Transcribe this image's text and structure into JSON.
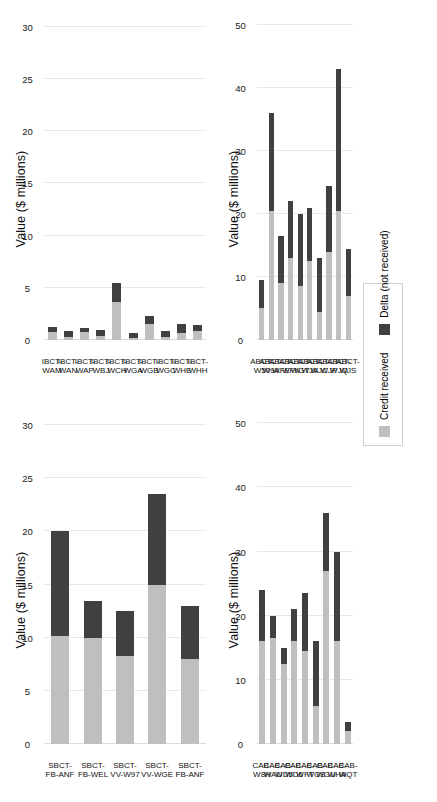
{
  "figure": {
    "width": 437,
    "height": 802,
    "background": "#ffffff",
    "orientation": "rotated-90-landscape-panels"
  },
  "legend": {
    "name": "chart-legend",
    "position": "middle-right",
    "items": [
      {
        "label": "Credit received",
        "color": "#bfbfbf",
        "key": "credit_received"
      },
      {
        "label": "Delta (not received)",
        "color": "#404040",
        "key": "delta_not_received"
      }
    ]
  },
  "colors": {
    "credit_received": "#bfbfbf",
    "delta_not_received": "#404040",
    "gridline": "#e9e9e9",
    "text": "#111111"
  },
  "chart_data": [
    {
      "id": "chart-ibct",
      "type": "bar",
      "orientation": "horizontal-stacked",
      "title": "",
      "xlabel": "Value ($ millions)",
      "ylabel": "",
      "xlim": [
        0,
        32
      ],
      "ticks": [
        0,
        5,
        10,
        15,
        20,
        25,
        30
      ],
      "grid": true,
      "legend_position": "external-right",
      "categories": [
        "IBCT-WAM",
        "IBCT-WAN",
        "IBCT-WAP",
        "IBCT-WBJ",
        "IBCT-WCH",
        "IBCT-WGA",
        "IBCT-WGB",
        "IBCT-WGC",
        "IBCT-WHE",
        "IBCT-WHH"
      ],
      "series": [
        {
          "name": "Credit received",
          "values": [
            0.75,
            0.3,
            0.75,
            0.35,
            3.6,
            0.15,
            1.5,
            0.25,
            0.7,
            0.85
          ]
        },
        {
          "name": "Delta (not received)",
          "values": [
            0.45,
            0.55,
            0.4,
            0.65,
            1.9,
            0.5,
            0.8,
            0.6,
            0.8,
            0.55
          ]
        }
      ]
    },
    {
      "id": "chart-abct",
      "type": "bar",
      "orientation": "horizontal-stacked",
      "title": "",
      "xlabel": "Value ($ millions)",
      "ylabel": "",
      "xlim": [
        0,
        53
      ],
      "ticks": [
        0,
        10,
        20,
        30,
        40,
        50
      ],
      "grid": true,
      "legend_position": "external-right",
      "categories": [
        "ABCT-W50",
        "ABCT-W9A",
        "ABCT-WFE",
        "ABCT-WFN",
        "ABCT-WGT",
        "ABCT-WJA",
        "ABCT-WJC",
        "ABCT-WJP",
        "ABCT-WJQ",
        "ABCT-WJS"
      ],
      "series": [
        {
          "name": "Credit received",
          "values": [
            5.0,
            20.5,
            9.0,
            13.0,
            8.5,
            12.5,
            4.5,
            14.0,
            20.5,
            7.0
          ]
        },
        {
          "name": "Delta (not received)",
          "values": [
            4.5,
            15.5,
            7.5,
            9.0,
            11.5,
            8.5,
            8.5,
            10.5,
            22.5,
            7.5
          ]
        }
      ]
    },
    {
      "id": "chart-sbct",
      "type": "bar",
      "orientation": "horizontal-stacked",
      "title": "",
      "xlabel": "Value ($ millions)",
      "ylabel": "",
      "xlim": [
        0,
        32
      ],
      "ticks": [
        0,
        5,
        10,
        15,
        20,
        25,
        30
      ],
      "grid": true,
      "legend_position": "external-right",
      "categories": [
        "SBCT-FB-ANF",
        "SBCT-FB-WEL",
        "SBCT-VV-W97",
        "SBCT-VV-WGE",
        "SBCT-FB-ANF"
      ],
      "series": [
        {
          "name": "Credit received",
          "values": [
            10.2,
            10.0,
            8.3,
            15.0,
            8.0
          ]
        },
        {
          "name": "Delta (not received)",
          "values": [
            9.8,
            3.5,
            4.2,
            8.5,
            5.0
          ]
        }
      ]
    },
    {
      "id": "chart-cab",
      "type": "bar",
      "orientation": "horizontal-stacked",
      "title": "",
      "xlabel": "Value ($ millions)",
      "ylabel": "",
      "xlim": [
        0,
        53
      ],
      "ticks": [
        0,
        10,
        20,
        30,
        40,
        50
      ],
      "grid": true,
      "legend_position": "external-right",
      "categories": [
        "CAB-W8H",
        "CAB-WAU",
        "CAB-WD5",
        "CAB-WD6",
        "CAB-WFT",
        "CAB-WGS",
        "CAB-WGU",
        "CAB-WHA",
        "CAB-WQT"
      ],
      "series": [
        {
          "name": "Credit received",
          "values": [
            16.0,
            16.5,
            12.5,
            16.0,
            14.5,
            6.0,
            27.0,
            16.0,
            2.0
          ]
        },
        {
          "name": "Delta (not received)",
          "values": [
            8.0,
            3.5,
            2.5,
            5.0,
            9.0,
            10.0,
            9.0,
            14.0,
            1.5
          ]
        }
      ]
    }
  ]
}
